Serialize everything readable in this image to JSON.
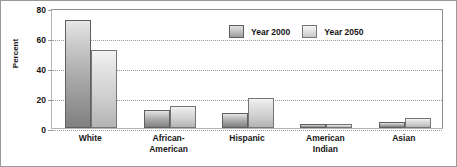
{
  "chart_data": {
    "type": "bar",
    "title": "",
    "subtitle": "",
    "xlabel": "",
    "ylabel": "Percent",
    "ylim": [
      0,
      80
    ],
    "yticks": [
      0,
      20,
      40,
      60,
      80
    ],
    "ytick_labels": [
      "0",
      "20",
      "40",
      "60",
      "80"
    ],
    "grid": true,
    "grid_axis": "y",
    "legend_position": "upper-center",
    "categories": [
      "White",
      "African-American",
      "Hispanic",
      "American Indian",
      "Asian"
    ],
    "category_label_lines": [
      [
        "White"
      ],
      [
        "African-",
        "American"
      ],
      [
        "Hispanic"
      ],
      [
        "American",
        "Indian"
      ],
      [
        "Asian"
      ]
    ],
    "series": [
      {
        "name": "Year 2000",
        "color": "#a8a8a8",
        "values": [
          72,
          12,
          10,
          1,
          4
        ]
      },
      {
        "name": "Year 2050",
        "color": "#dcdcdc",
        "values": [
          52,
          15,
          20,
          1,
          7
        ]
      }
    ],
    "legend": [
      "Year 2000",
      "Year 2050"
    ],
    "units": "percent"
  },
  "colors": {
    "series_2000": "#a8a8a8",
    "series_2050": "#dcdcdc",
    "axis": "#8d8d8d",
    "gridline": "#9b9b9b",
    "text": "#151515",
    "background": "#ffffff"
  }
}
